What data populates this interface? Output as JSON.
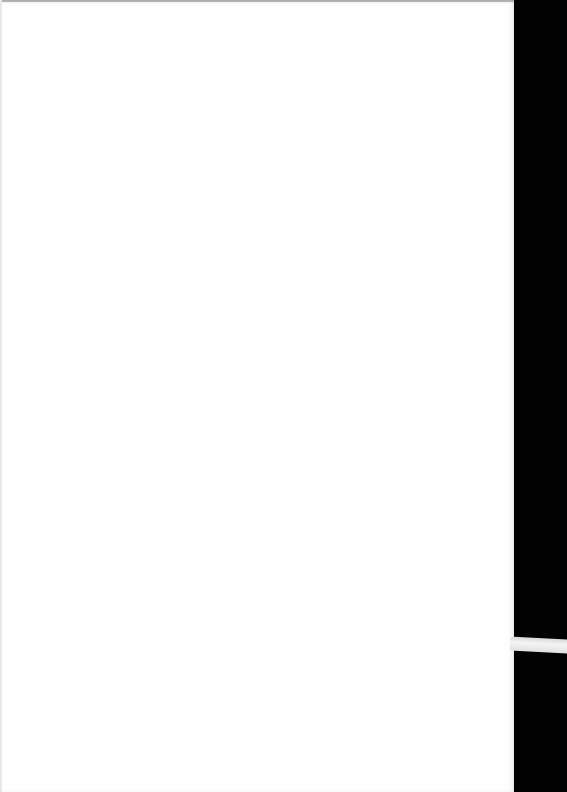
{
  "document": {
    "type": "scanned-page",
    "content": "",
    "is_blank": true
  },
  "colors": {
    "paper": "#fefefe",
    "scanner_bed": "#020202",
    "strip": "#e6e6e6"
  }
}
